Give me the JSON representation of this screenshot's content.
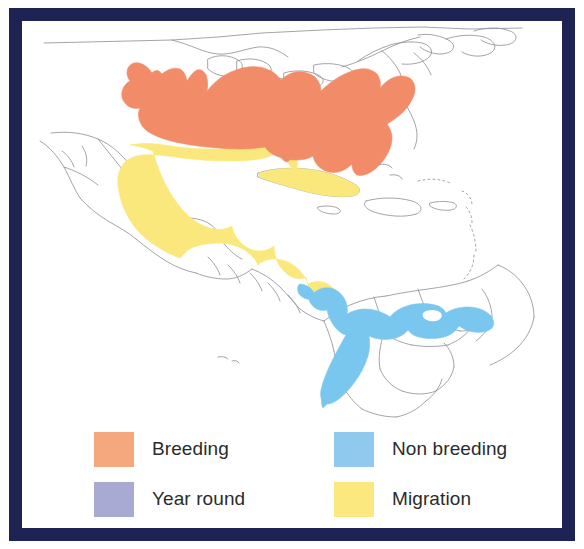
{
  "figure": {
    "type": "species-range-map",
    "region": "The Americas",
    "frame_color": "#1d2453",
    "background_color": "#ffffff",
    "coastline_color": "#8d8d93"
  },
  "map": {
    "alt": "Range map of the Americas showing breeding, non breeding and migration areas",
    "areas": [
      {
        "id": "breeding",
        "label": "Breeding",
        "color": "#F28B68",
        "description": "Eastern and central United States including Florida"
      },
      {
        "id": "migration",
        "label": "Migration",
        "color": "#FAE87C",
        "description": "Gulf coast, Mexico, Central America and Cuba"
      },
      {
        "id": "non_breeding",
        "label": "Non breeding",
        "color": "#79C7EF",
        "description": "Panama, Colombia, Venezuela and western Ecuador and Peru"
      },
      {
        "id": "year_round",
        "label": "Year round",
        "color": "#A3A6D4",
        "description": "Not present on this map"
      }
    ]
  },
  "legend": {
    "items": [
      {
        "label": "Breeding",
        "color": "#F5A87E",
        "swatch_name": "legend-swatch-breeding"
      },
      {
        "label": "Non breeding",
        "color": "#8FC9EE",
        "swatch_name": "legend-swatch-non-breeding"
      },
      {
        "label": "Year round",
        "color": "#A8AAD4",
        "swatch_name": "legend-swatch-year-round"
      },
      {
        "label": "Migration",
        "color": "#FBE87E",
        "swatch_name": "legend-swatch-migration"
      }
    ]
  }
}
